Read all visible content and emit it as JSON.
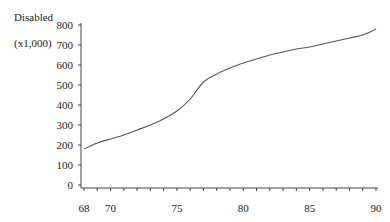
{
  "chart_data": {
    "type": "line",
    "title": "",
    "xlabel": "",
    "ylabel": "Disabled (x1,000)",
    "ylabel_lines": [
      "Disabled",
      "(x1,000)"
    ],
    "xlim": [
      68,
      90
    ],
    "ylim": [
      0,
      800
    ],
    "grid": false,
    "legend": null,
    "x_ticks": [
      68,
      70,
      75,
      80,
      85,
      90
    ],
    "x_minor_ticks": [
      68,
      69,
      70,
      71,
      72,
      73,
      74,
      75,
      76,
      77,
      78,
      79,
      80,
      81,
      82,
      83,
      84,
      85,
      86,
      87,
      88,
      89,
      90
    ],
    "y_ticks": [
      0,
      100,
      200,
      300,
      400,
      500,
      600,
      700,
      800
    ],
    "series": [
      {
        "name": "Disabled",
        "color": "#555555",
        "x": [
          68,
          69,
          70,
          71,
          72,
          73,
          74,
          75,
          76,
          77,
          78,
          79,
          80,
          81,
          82,
          83,
          84,
          85,
          86,
          87,
          88,
          89,
          90
        ],
        "values": [
          180,
          210,
          230,
          250,
          275,
          300,
          330,
          370,
          430,
          515,
          555,
          585,
          610,
          630,
          650,
          665,
          680,
          690,
          705,
          720,
          735,
          750,
          780
        ]
      }
    ]
  }
}
